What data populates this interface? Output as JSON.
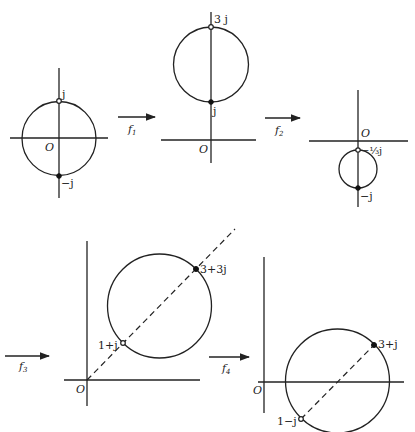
{
  "diagram": {
    "panels": [
      {
        "id": "z-plane",
        "origin_label": "O",
        "points": [
          {
            "label": "j",
            "marker": "open"
          },
          {
            "label": "−j",
            "marker": "filled"
          }
        ]
      },
      {
        "id": "after-f1",
        "origin_label": "O",
        "points": [
          {
            "label": "3 j",
            "marker": "open"
          },
          {
            "label": "j",
            "marker": "filled"
          }
        ]
      },
      {
        "id": "after-f2",
        "origin_label": "O",
        "points": [
          {
            "label": "−⅓j",
            "marker": "open"
          },
          {
            "label": "−j",
            "marker": "filled"
          }
        ]
      },
      {
        "id": "after-f3",
        "origin_label": "O",
        "points": [
          {
            "label": "1+j",
            "marker": "open"
          },
          {
            "label": "3+3j",
            "marker": "filled"
          }
        ]
      },
      {
        "id": "after-f4",
        "origin_label": "O",
        "points": [
          {
            "label": "1−j",
            "marker": "open"
          },
          {
            "label": "3+j",
            "marker": "filled"
          }
        ]
      }
    ],
    "arrows": [
      {
        "label": "f",
        "sub": "1"
      },
      {
        "label": "f",
        "sub": "2"
      },
      {
        "label": "f",
        "sub": "3"
      },
      {
        "label": "f",
        "sub": "4"
      }
    ],
    "colors": {
      "ink": "#222222",
      "background": "#ffffff"
    }
  }
}
